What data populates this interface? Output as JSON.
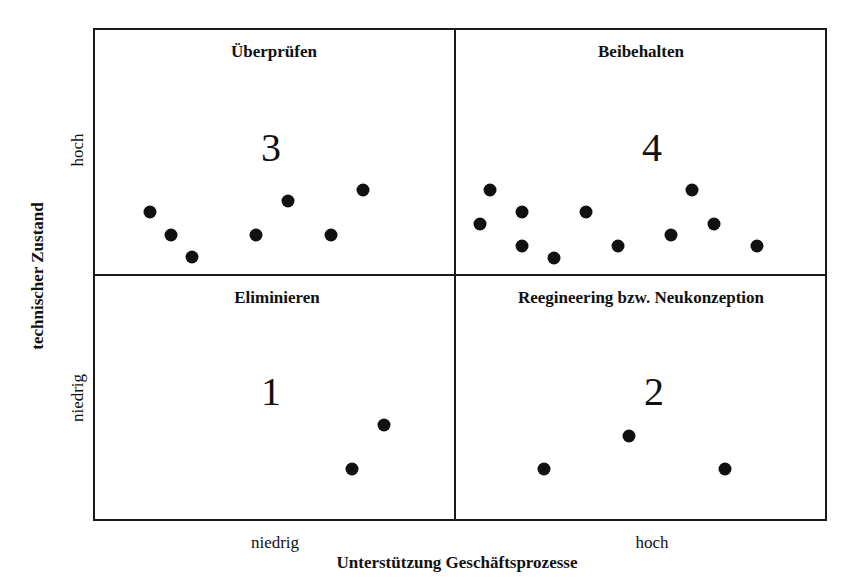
{
  "chart_data": {
    "type": "scatter",
    "title": "",
    "xlabel": "Unterstützung Geschäftsprozesse",
    "ylabel": "technischer Zustand",
    "x_ticks": [
      "niedrig",
      "hoch"
    ],
    "y_ticks": [
      "niedrig",
      "hoch"
    ],
    "quadrants": [
      {
        "id": "q3",
        "number": "3",
        "title": "Überprüfen",
        "position": "top-left",
        "points": [
          [
            150,
            212
          ],
          [
            171,
            235
          ],
          [
            192,
            257
          ],
          [
            256,
            235
          ],
          [
            288,
            201
          ],
          [
            331,
            235
          ],
          [
            363,
            190
          ]
        ]
      },
      {
        "id": "q4",
        "number": "4",
        "title": "Beibehalten",
        "position": "top-right",
        "points": [
          [
            480,
            224
          ],
          [
            490,
            190
          ],
          [
            522,
            212
          ],
          [
            522,
            246
          ],
          [
            554,
            258
          ],
          [
            586,
            212
          ],
          [
            618,
            246
          ],
          [
            671,
            235
          ],
          [
            692,
            190
          ],
          [
            714,
            224
          ],
          [
            757,
            246
          ]
        ]
      },
      {
        "id": "q1",
        "number": "1",
        "title": "Eliminieren",
        "position": "bottom-left",
        "points": [
          [
            352,
            469
          ],
          [
            384,
            425
          ]
        ]
      },
      {
        "id": "q2",
        "number": "2",
        "title": "Reegineering bzw. Neukonzeption",
        "position": "bottom-right",
        "points": [
          [
            544,
            469
          ],
          [
            629,
            436
          ],
          [
            725,
            469
          ]
        ]
      }
    ]
  },
  "axes": {
    "x_title": "Unterstützung Geschäftsprozesse",
    "x_low": "niedrig",
    "x_high": "hoch",
    "y_title": "technischer Zustand",
    "y_low": "niedrig",
    "y_high": "hoch"
  }
}
